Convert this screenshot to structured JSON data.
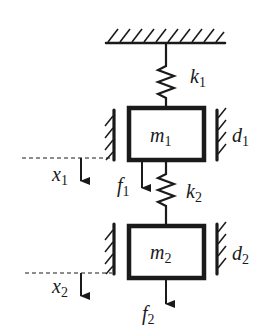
{
  "diagram": {
    "colors": {
      "stroke": "#1a1a1a",
      "background": "#ffffff"
    },
    "ceiling": {
      "label": "fixed support"
    },
    "springs": [
      {
        "id": "k1",
        "symbol": "k",
        "subscript": "1",
        "between": [
          "ceiling",
          "m1"
        ]
      },
      {
        "id": "k2",
        "symbol": "k",
        "subscript": "2",
        "between": [
          "m1",
          "m2"
        ]
      }
    ],
    "masses": [
      {
        "id": "m1",
        "symbol": "m",
        "subscript": "1"
      },
      {
        "id": "m2",
        "symbol": "m",
        "subscript": "2"
      }
    ],
    "dampers": [
      {
        "id": "d1",
        "symbol": "d",
        "subscript": "1",
        "on": "m1"
      },
      {
        "id": "d2",
        "symbol": "d",
        "subscript": "2",
        "on": "m2"
      }
    ],
    "displacements": [
      {
        "id": "x1",
        "symbol": "x",
        "subscript": "1",
        "direction": "down"
      },
      {
        "id": "x2",
        "symbol": "x",
        "subscript": "2",
        "direction": "down"
      }
    ],
    "forces": [
      {
        "id": "f1",
        "symbol": "f",
        "subscript": "1",
        "direction": "down",
        "on": "m1"
      },
      {
        "id": "f2",
        "symbol": "f",
        "subscript": "2",
        "direction": "down",
        "on": "m2"
      }
    ]
  }
}
